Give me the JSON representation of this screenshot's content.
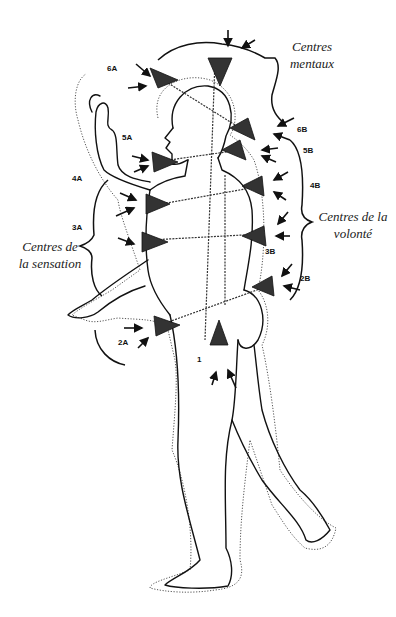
{
  "figure": {
    "groups": {
      "mental": {
        "line1": "Centres",
        "line2": "mentaux"
      },
      "will": {
        "line1": "Centres de la",
        "line2": "volonté"
      },
      "sensation": {
        "line1": "Centres de",
        "line2": "la sensation"
      }
    },
    "labels": {
      "c6A": "6A",
      "c5A": "5A",
      "c4A": "4A",
      "c3A": "3A",
      "c2A": "2A",
      "c1": "1",
      "c6B": "6B",
      "c5B": "5B",
      "c4B": "4B",
      "c3B": "3B",
      "c2B": "2B"
    }
  }
}
